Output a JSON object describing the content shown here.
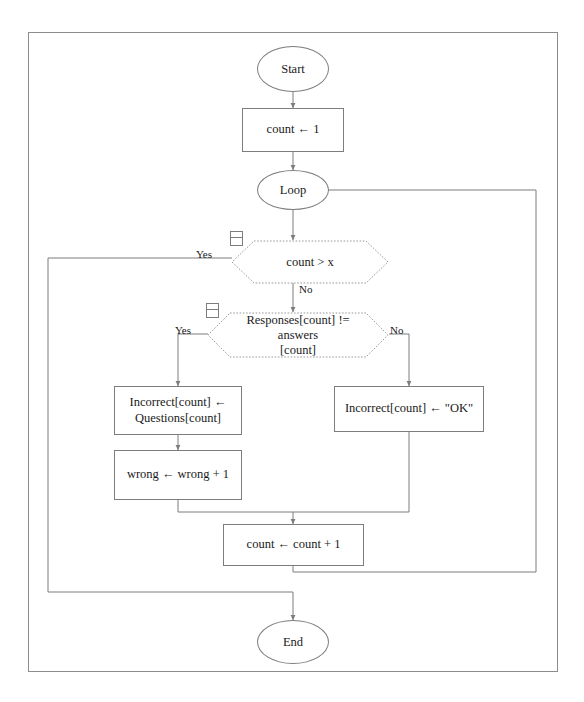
{
  "document": {
    "type": "flowchart",
    "border_color": "#8c8c8c",
    "stroke_color": "#7d7d7d",
    "text_color": "#1a1a1a",
    "background": "#ffffff"
  },
  "nodes": {
    "start": {
      "label": "Start",
      "shape": "ellipse"
    },
    "init_count": {
      "label": "count ← 1",
      "shape": "rectangle"
    },
    "loop": {
      "label": "Loop",
      "shape": "ellipse"
    },
    "check_count": {
      "label": "count > x",
      "shape": "decision"
    },
    "check_answer_line1": "Responses[count] != answers",
    "check_answer_line2": "[count]",
    "incorrect_question_line1": "Incorrect[count] ←",
    "incorrect_question_line2": "Questions[count]",
    "wrong_increment": {
      "label": "wrong ← wrong + 1",
      "shape": "rectangle"
    },
    "incorrect_ok": {
      "label": "Incorrect[count] ← \"OK\"",
      "shape": "rectangle"
    },
    "count_increment": {
      "label": "count ← count + 1",
      "shape": "rectangle"
    },
    "end": {
      "label": "End",
      "shape": "ellipse"
    }
  },
  "edge_labels": {
    "count_yes": "Yes",
    "count_no": "No",
    "answer_yes": "Yes",
    "answer_no": "No"
  },
  "icons": {
    "collapse_badge": "collapse-handle-icon"
  }
}
